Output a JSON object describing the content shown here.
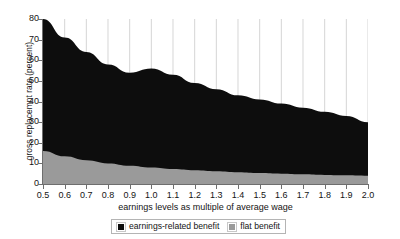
{
  "chart_data": {
    "type": "area",
    "stacked": true,
    "title": "",
    "subtitle": "",
    "xlabel": "earnings levels as multiple of average wage",
    "ylabel": "gross replacemnt rate (percent)",
    "xlim": [
      0.5,
      2.0
    ],
    "ylim": [
      0,
      80
    ],
    "grid": false,
    "legend_position": "bottom",
    "x": [
      0.5,
      0.6,
      0.7,
      0.8,
      0.9,
      1.0,
      1.1,
      1.2,
      1.3,
      1.4,
      1.5,
      1.6,
      1.7,
      1.8,
      1.9,
      2.0
    ],
    "xticklabels": [
      "0.5",
      "0.6",
      "0.7",
      "0.8",
      "0.9",
      "1.0",
      "1.1",
      "1.2",
      "1.3",
      "1.4",
      "1.5",
      "1.6",
      "1.7",
      "1.8",
      "1.9",
      "2.0"
    ],
    "yticks": [
      0,
      10,
      20,
      30,
      40,
      50,
      60,
      70,
      80
    ],
    "yticklabels": [
      "0",
      "10",
      "20",
      "30",
      "40",
      "50",
      "60",
      "70",
      "80"
    ],
    "series": [
      {
        "name": "flat benefit",
        "color": "#9a9a9a",
        "values": [
          16.0,
          13.4,
          11.5,
          10.0,
          8.9,
          8.0,
          7.3,
          6.7,
          6.2,
          5.7,
          5.3,
          5.0,
          4.7,
          4.4,
          4.2,
          4.0
        ]
      },
      {
        "name": "earnings-related benefit",
        "color": "#0d0d0d",
        "values": [
          64.0,
          57.6,
          52.5,
          48.0,
          45.1,
          48.0,
          45.7,
          42.3,
          39.8,
          37.3,
          35.7,
          34.0,
          32.3,
          30.6,
          28.8,
          26.0
        ]
      }
    ],
    "totals": [
      80.0,
      71.0,
      64.0,
      58.0,
      54.0,
      56.0,
      53.0,
      49.0,
      46.0,
      43.0,
      41.0,
      39.0,
      37.0,
      35.0,
      33.0,
      30.0
    ]
  },
  "axes": {
    "y_title": "gross replacemnt rate (percent)",
    "x_title": "earnings levels as multiple of average wage"
  },
  "legend": {
    "items": [
      {
        "label": "earnings-related benefit",
        "color": "#0d0d0d"
      },
      {
        "label": "flat benefit",
        "color": "#9a9a9a"
      }
    ]
  }
}
